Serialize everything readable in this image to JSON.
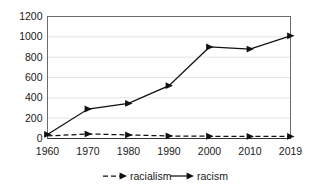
{
  "chart_data": {
    "type": "line",
    "title": "",
    "xlabel": "",
    "ylabel": "",
    "categories": [
      "1960",
      "1970",
      "1980",
      "1990",
      "2000",
      "2010",
      "2019"
    ],
    "x": [
      1960,
      1970,
      1980,
      1990,
      2000,
      2010,
      2019
    ],
    "series": [
      {
        "name": "racialism",
        "style": "dashed",
        "marker": "triangle-right",
        "values": [
          25,
          45,
          35,
          25,
          22,
          20,
          20
        ]
      },
      {
        "name": "racism",
        "style": "solid",
        "marker": "triangle-right",
        "values": [
          40,
          290,
          345,
          520,
          900,
          880,
          1010
        ]
      }
    ],
    "ylim": [
      0,
      1200
    ],
    "yticks": [
      0,
      200,
      400,
      600,
      800,
      1000,
      1200
    ],
    "ytick_labels": [
      "0",
      "200",
      "400",
      "600",
      "800",
      "1000",
      "1200"
    ],
    "xtick_labels": [
      "1960",
      "1970",
      "1980",
      "1990",
      "2000",
      "2010",
      "2019"
    ],
    "grid": true,
    "grid_axis": "y",
    "legend": [
      "racialism",
      "racism"
    ],
    "legend_position": "bottom",
    "colors": {
      "line": "#111111",
      "grid": "#d9d9d9",
      "frame": "#6b6b6b",
      "text": "#1a1a1a",
      "background": "#ffffff"
    }
  }
}
